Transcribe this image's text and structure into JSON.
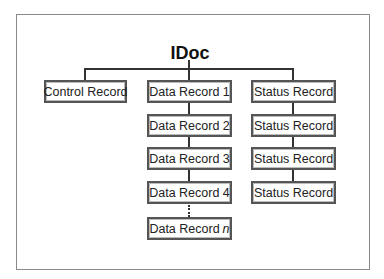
{
  "diagram": {
    "title": "IDoc",
    "control_record": {
      "label": "Control Record"
    },
    "data_records": [
      {
        "label": "Data Record 1"
      },
      {
        "label": "Data Record 2"
      },
      {
        "label": "Data Record 3"
      },
      {
        "label": "Data Record 4"
      }
    ],
    "data_record_n": {
      "prefix": "Data Record",
      "suffix": "n"
    },
    "status_records": [
      {
        "label": "Status Record"
      },
      {
        "label": "Status Record"
      },
      {
        "label": "Status Record"
      },
      {
        "label": "Status Record"
      }
    ],
    "ellipsis": "⋮"
  }
}
